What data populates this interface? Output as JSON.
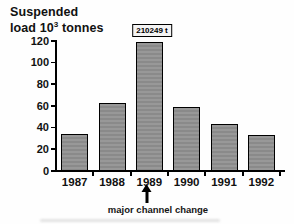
{
  "figure": {
    "title_line1": "Suspended",
    "title_line2_pre": "load 10",
    "title_exponent": "3",
    "title_line2_post": " tonnes"
  },
  "annotations": {
    "value_box_label": "210249 t",
    "value_box_target": "1989",
    "event_label": "major channel change",
    "event_target": "1989"
  },
  "chart_data": {
    "type": "bar",
    "ylabel": "Suspended load 10³ tonnes",
    "xlabel": "",
    "categories": [
      "1987",
      "1988",
      "1989",
      "1990",
      "1991",
      "1992"
    ],
    "values": [
      34,
      63,
      119,
      59,
      43,
      33
    ],
    "ylim": [
      0,
      120
    ],
    "yticks": [
      0,
      20,
      40,
      60,
      80,
      100,
      120
    ],
    "grid": false,
    "legend": false,
    "bar_color": "#909090",
    "bar_border_color": "#000000",
    "annotation_1989_label": "210249 t",
    "annotation_below_axis": "major channel change"
  }
}
